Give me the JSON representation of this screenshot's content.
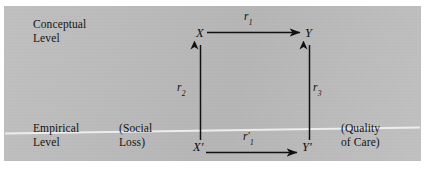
{
  "figure": {
    "type": "path-diagram",
    "background_color": "#bdbdbd",
    "ink_color": "#111111",
    "divider_color": "#efefef"
  },
  "levels": {
    "conceptual": "Conceptual\nLevel",
    "empirical": "Empirical\nLevel"
  },
  "annotations": {
    "social_loss": "(Social\nLoss)",
    "quality_of_care": "(Quality\nof Care)"
  },
  "nodes": {
    "x": "X",
    "y": "Y",
    "x_prime": "X′",
    "y_prime": "Y′"
  },
  "coefficients": {
    "r1": {
      "symbol": "r",
      "subscript": "1",
      "prime": false
    },
    "r2": {
      "symbol": "r",
      "subscript": "2",
      "prime": false
    },
    "r3": {
      "symbol": "r",
      "subscript": "3",
      "prime": false
    },
    "r1_prime": {
      "symbol": "r",
      "subscript": "1",
      "prime": true
    }
  },
  "arrows": [
    {
      "name": "x-to-y",
      "from": "X",
      "to": "Y",
      "label": "r1",
      "direction": "right"
    },
    {
      "name": "xprime-to-x",
      "from": "X′",
      "to": "X",
      "label": "r2",
      "direction": "up"
    },
    {
      "name": "yprime-to-y",
      "from": "Y′",
      "to": "Y",
      "label": "r3",
      "direction": "up"
    },
    {
      "name": "xprime-to-yprime",
      "from": "X′",
      "to": "Y′",
      "label": "r1_prime",
      "direction": "right"
    }
  ]
}
